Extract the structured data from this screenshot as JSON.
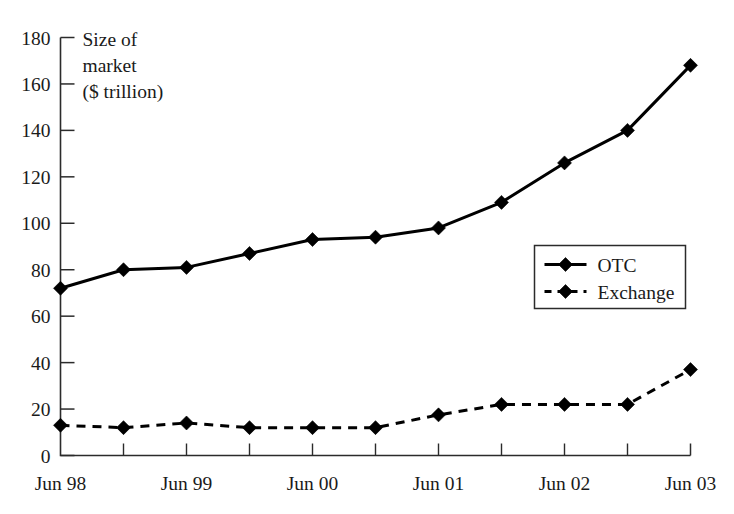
{
  "chart_data": {
    "type": "line",
    "title": "",
    "subtitle": "",
    "xlabel": "",
    "ylabel": "Size of market ($ trillion)",
    "ylabel_lines": [
      "Size of",
      "market",
      "($ trillion)"
    ],
    "x": [
      "Jun 98",
      "Dec 98",
      "Jun 99",
      "Dec 99",
      "Jun 00",
      "Dec 00",
      "Jun 01",
      "Dec 01",
      "Jun 02",
      "Dec 02",
      "Jun 03"
    ],
    "x_tick_labels": [
      "Jun 98",
      "Jun 99",
      "Jun 00",
      "Jun 01",
      "Jun 02",
      "Jun 03"
    ],
    "x_major_label_indices": [
      0,
      2,
      4,
      6,
      8,
      10
    ],
    "y_ticks": [
      0,
      20,
      40,
      60,
      80,
      100,
      120,
      140,
      160,
      180
    ],
    "ylim": [
      0,
      180
    ],
    "grid": false,
    "legend_position": "middle-right",
    "series": [
      {
        "name": "OTC",
        "style": "solid",
        "marker": "diamond",
        "color": "#000000",
        "values": [
          72,
          80,
          81,
          87,
          93,
          94,
          98,
          109,
          126,
          140,
          168
        ]
      },
      {
        "name": "Exchange",
        "style": "dashed",
        "marker": "diamond",
        "color": "#000000",
        "values": [
          13,
          12,
          14,
          12,
          12,
          12,
          17.5,
          22,
          22,
          22,
          37
        ]
      }
    ]
  },
  "legend": {
    "items": [
      {
        "label": "OTC",
        "style": "solid"
      },
      {
        "label": "Exchange",
        "style": "dashed"
      }
    ]
  }
}
